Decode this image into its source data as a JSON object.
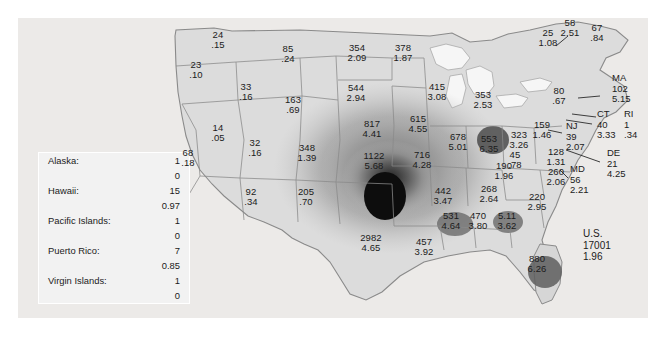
{
  "figure": {
    "background": "#ffffff",
    "panel_background": "#eceae8",
    "land_fill": "#dcdcdc",
    "outline": "#8a8a8a",
    "water_fill": "#f6f6f6",
    "text_color": "#1b1b1b"
  },
  "us_total": {
    "label": "U.S.",
    "count": "17001",
    "rate": "1.96"
  },
  "legend": {
    "rows": [
      {
        "name": "Alaska:",
        "count": "1",
        "rate": "0"
      },
      {
        "name": "Hawaii:",
        "count": "15",
        "rate": "0.97"
      },
      {
        "name": "Pacific Islands:",
        "count": "1",
        "rate": "0"
      },
      {
        "name": "Puerto Rico:",
        "count": "7",
        "rate": "0.85"
      },
      {
        "name": "Virgin Islands:",
        "count": "1",
        "rate": "0"
      }
    ]
  },
  "chart_data": {
    "type": "map",
    "title": "",
    "value_labels": [
      "count",
      "rate"
    ],
    "states": [
      {
        "id": "WA",
        "count": "24",
        "rate": ".15",
        "x": 218,
        "y": 40
      },
      {
        "id": "OR",
        "count": "23",
        "rate": ".10",
        "x": 196,
        "y": 70
      },
      {
        "id": "MT",
        "count": "85",
        "rate": ".24",
        "x": 288,
        "y": 54
      },
      {
        "id": "ID",
        "count": "33",
        "rate": ".16",
        "x": 246,
        "y": 92
      },
      {
        "id": "WY",
        "count": "163",
        "rate": ".69",
        "x": 293,
        "y": 105
      },
      {
        "id": "ND",
        "count": "354",
        "rate": "2.09",
        "x": 357,
        "y": 53
      },
      {
        "id": "MN",
        "count": "378",
        "rate": "1.87",
        "x": 403,
        "y": 53
      },
      {
        "id": "SD",
        "count": "544",
        "rate": "2.94",
        "x": 356,
        "y": 93
      },
      {
        "id": "NV",
        "count": "14",
        "rate": ".05",
        "x": 218,
        "y": 133
      },
      {
        "id": "UT",
        "count": "32",
        "rate": ".16",
        "x": 255,
        "y": 148
      },
      {
        "id": "CO",
        "count": "348",
        "rate": "1.39",
        "x": 307,
        "y": 153
      },
      {
        "id": "CA",
        "count": "68",
        "rate": ".18",
        "x": 188,
        "y": 158
      },
      {
        "id": "AZ",
        "count": "92",
        "rate": ".34",
        "x": 251,
        "y": 197
      },
      {
        "id": "NM",
        "count": "205",
        "rate": ".70",
        "x": 306,
        "y": 197
      },
      {
        "id": "NE",
        "count": "817",
        "rate": "4.41",
        "x": 372,
        "y": 129
      },
      {
        "id": "IA",
        "count": "615",
        "rate": "4.55",
        "x": 418,
        "y": 124
      },
      {
        "id": "KS",
        "count": "1122",
        "rate": "5.68",
        "x": 374,
        "y": 161
      },
      {
        "id": "MO",
        "count": "716",
        "rate": "4.28",
        "x": 422,
        "y": 160
      },
      {
        "id": "WI",
        "count": "415",
        "rate": "3.08",
        "x": 437,
        "y": 92
      },
      {
        "id": "MI",
        "count": "353",
        "rate": "2.53",
        "x": 483,
        "y": 100
      },
      {
        "id": "IL",
        "count": "678",
        "rate": "5.01",
        "x": 458,
        "y": 142
      },
      {
        "id": "IN",
        "count": "553",
        "rate": "6.35",
        "x": 489,
        "y": 144
      },
      {
        "id": "OH",
        "count": "323",
        "rate": "3.26",
        "x": 519,
        "y": 140
      },
      {
        "id": "PA",
        "count": "159",
        "rate": "1.46",
        "x": 542,
        "y": 130
      },
      {
        "id": "NY",
        "count": "80",
        "rate": ".67",
        "x": 559,
        "y": 96
      },
      {
        "id": "KY",
        "count": "190",
        "rate": "1.96",
        "x": 504,
        "y": 171
      },
      {
        "id": "WV",
        "count": "45",
        "rate": ".78",
        "x": 515,
        "y": 160
      },
      {
        "id": "TN",
        "count": "268",
        "rate": "2.64",
        "x": 489,
        "y": 194
      },
      {
        "id": "VA",
        "count": "260",
        "rate": "2.06",
        "x": 556,
        "y": 177
      },
      {
        "id": "NC",
        "count": "220",
        "rate": "2.95",
        "x": 537,
        "y": 202
      },
      {
        "id": "AR",
        "count": "442",
        "rate": "3.47",
        "x": 443,
        "y": 196
      },
      {
        "id": "OK",
        "count": "457",
        "rate": "3.92",
        "x": 424,
        "y": 247
      },
      {
        "id": "TX",
        "count": "2982",
        "rate": "4.65",
        "x": 371,
        "y": 243
      },
      {
        "id": "LA",
        "count": "531",
        "rate": "4.64",
        "x": 451,
        "y": 221
      },
      {
        "id": "MS",
        "count": "470",
        "rate": "3.80",
        "x": 478,
        "y": 221
      },
      {
        "id": "AL",
        "count": "5.11",
        "rate": "3.62",
        "x": 507,
        "y": 221
      },
      {
        "id": "GA",
        "count": "880",
        "rate": "6.26",
        "x": 537,
        "y": 264
      },
      {
        "id": "VT",
        "count": "58",
        "rate": "2.51",
        "x": 570,
        "y": 28
      },
      {
        "id": "NH",
        "count": "25",
        "rate": "1.08",
        "x": 548,
        "y": 38
      },
      {
        "id": "ME",
        "count": "67",
        "rate": ".84",
        "x": 597,
        "y": 33
      }
    ],
    "callouts": [
      {
        "id": "MA",
        "name": "MA",
        "count": "102",
        "rate": "5.15",
        "x": 612,
        "y": 85
      },
      {
        "id": "RI",
        "name": "RI",
        "count": "1",
        "rate": ".34",
        "x": 624,
        "y": 121
      },
      {
        "id": "CT",
        "name": "CT",
        "count": "40",
        "rate": "3.33",
        "x": 597,
        "y": 121
      },
      {
        "id": "NJ",
        "name": "NJ",
        "count": "39",
        "rate": "2.07",
        "x": 566,
        "y": 133
      },
      {
        "id": "DE",
        "name": "DE",
        "count": "21",
        "rate": "4.25",
        "x": 607,
        "y": 160
      },
      {
        "id": "MD",
        "name": "MD",
        "count": "56",
        "rate": "2.21",
        "x": 570,
        "y": 176
      }
    ],
    "unlabeled": [
      {
        "id": "SC",
        "count": "128",
        "rate": "1.31",
        "x": 556,
        "y": 157
      }
    ]
  }
}
